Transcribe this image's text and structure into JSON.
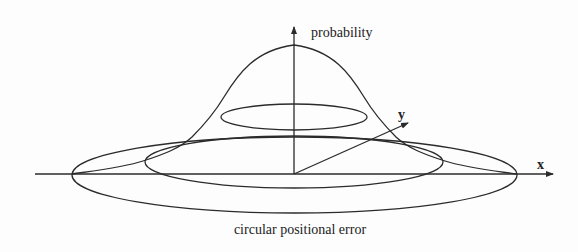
{
  "diagram": {
    "labels": {
      "vertical_axis": "probability",
      "x_axis": "x",
      "y_axis": "y",
      "caption": "circular positional error"
    },
    "elements": [
      "bell-shaped probability surface",
      "small ellipse (upper contour)",
      "medium ellipse (error circle in perspective)",
      "large ellipse (outer error circle in perspective)",
      "x axis",
      "y axis",
      "probability axis"
    ],
    "colors": {
      "line": "#2b2b2b",
      "background": "#fdfdfd"
    }
  }
}
